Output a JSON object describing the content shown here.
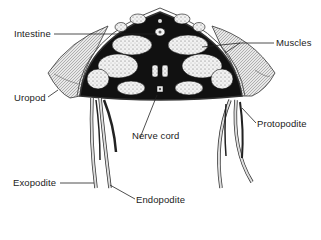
{
  "figure": {
    "labels": {
      "intestine": "Intestine",
      "muscles": "Muscles",
      "uropod": "Uropod",
      "nerve_cord": "Nerve cord",
      "protopodite": "Protopodite",
      "exopodite": "Exopodite",
      "endopodite": "Endopodite"
    }
  }
}
